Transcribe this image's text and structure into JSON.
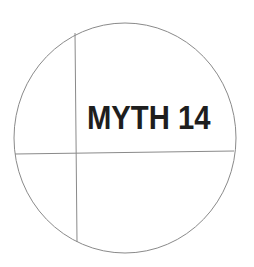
{
  "diagram": {
    "label": "MYTH 14",
    "circle": {
      "cx": 125,
      "cy": 138,
      "rx": 111,
      "ry": 115,
      "stroke": "#8a8a8a"
    },
    "vertical_line": {
      "x1": 75,
      "y1": 33,
      "x2": 77,
      "y2": 242,
      "stroke": "#8a8a8a"
    },
    "horizontal_line": {
      "x1": 15,
      "y1": 154,
      "x2": 234,
      "y2": 151,
      "stroke": "#8a8a8a"
    },
    "text_color": "#1e1e1e"
  }
}
